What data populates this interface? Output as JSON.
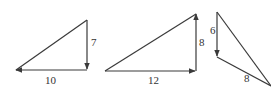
{
  "diagram": {
    "triangles": [
      {
        "id": "triangle-1",
        "vertical_label": "7",
        "horizontal_label": "10",
        "vertical_direction": "down",
        "horizontal_direction": "left"
      },
      {
        "id": "triangle-2",
        "vertical_label": "8",
        "horizontal_label": "12",
        "vertical_direction": "up",
        "horizontal_direction": "right"
      },
      {
        "id": "triangle-3",
        "vertical_label": "6",
        "diagonal_label": "8",
        "vertical_direction": "down"
      }
    ],
    "colors": {
      "stroke": "#3a3a3a",
      "background": "#ffffff"
    }
  }
}
